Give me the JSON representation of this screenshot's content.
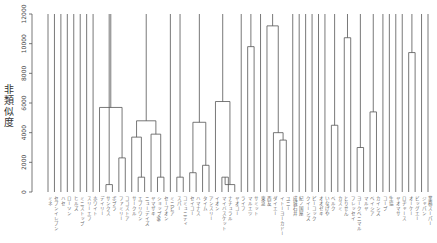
{
  "chart_data": {
    "type": "dendrogram",
    "title": "",
    "xlabel": "",
    "ylabel": "非類似度",
    "ylim": [
      0,
      12000
    ],
    "yticks": [
      0,
      2000,
      4000,
      6000,
      8000,
      10000,
      12000
    ],
    "grid": false,
    "leaf_count": 60,
    "leaf_labels": [
      "ミネ",
      "セブンイレブン",
      "ハセ",
      "ローソン",
      "ヒルズ",
      "ミニストップ",
      "スリーエフ",
      "ホワイト",
      "デイリー",
      "サンクス",
      "ポプラ",
      "ファミリー",
      "ココストア",
      "サークル",
      "エブリワン",
      "ニューデイズ",
      "ヤマザキ",
      "ショップ99",
      "セーブオン",
      "ミニピア",
      "スパー",
      "コミュニティ",
      "セイコー",
      "ハマナス",
      "タイム",
      "アンスリー",
      "イオン",
      "マイバスケット",
      "ナチュラル",
      "ヤオコー",
      "ライフ",
      "マルエツ",
      "サミット",
      "東急",
      "西友",
      "ダイエー",
      "イトーヨーカドー",
      "ユニー",
      "成城石井",
      "紀ノ国屋",
      "クイーンズ",
      "ピーコック",
      "オオゼキ",
      "いなげや",
      "ベルク",
      "カスミ",
      "とりせん",
      "フレッセイ",
      "ヨークベニマル",
      "マルヤ",
      "ベイシア",
      "カインズ",
      "コープ",
      "生協",
      "ヤオマサ",
      "ロヂャース",
      "オーケー",
      "ビッグエー",
      "ジャパン",
      "業務スーパー"
    ],
    "merges_note": "merge heights in dissimilarity units; leaves without merges extend to top (12000)",
    "merges": [
      {
        "left": 9,
        "right": 10,
        "height": 500
      },
      {
        "left": 11,
        "right": 12,
        "height": 2300
      },
      {
        "left": 8,
        "right": 11,
        "height": 5700
      },
      {
        "left": 14,
        "right": 15,
        "height": 1000
      },
      {
        "left": 13,
        "right": 14,
        "height": 3700
      },
      {
        "left": 17,
        "right": 18,
        "height": 1000
      },
      {
        "left": 16,
        "right": 17,
        "height": 3900
      },
      {
        "left": 13,
        "right": 16,
        "height": 4800
      },
      {
        "left": 20,
        "right": 21,
        "height": 1000
      },
      {
        "left": 22,
        "right": 23,
        "height": 1300
      },
      {
        "left": 24,
        "right": 25,
        "height": 1800
      },
      {
        "left": 22,
        "right": 24,
        "height": 4700
      },
      {
        "left": 27,
        "right": 28,
        "height": 1000
      },
      {
        "left": 28,
        "right": 29,
        "height": 500
      },
      {
        "left": 26,
        "right": 27,
        "height": 6100
      },
      {
        "left": 31,
        "right": 32,
        "height": 9800
      },
      {
        "left": 36,
        "right": 37,
        "height": 3500
      },
      {
        "left": 35,
        "right": 36,
        "height": 4000
      },
      {
        "left": 34,
        "right": 35,
        "height": 11200
      },
      {
        "left": 44,
        "right": 45,
        "height": 4500
      },
      {
        "left": 46,
        "right": 47,
        "height": 10400
      },
      {
        "left": 48,
        "right": 49,
        "height": 3000
      },
      {
        "left": 50,
        "right": 51,
        "height": 5400
      },
      {
        "left": 56,
        "right": 57,
        "height": 9400
      }
    ]
  },
  "axis": {
    "y_label": "非類似度",
    "tick_labels": [
      "0",
      "2000",
      "4000",
      "6000",
      "8000",
      "10000",
      "12000"
    ]
  }
}
